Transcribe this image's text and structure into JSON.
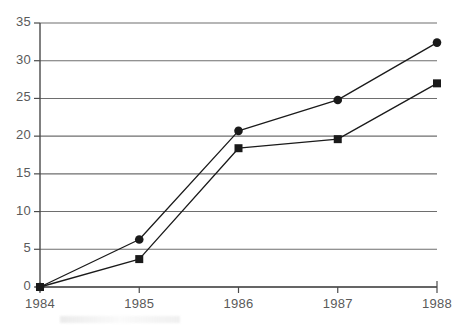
{
  "chart_data": {
    "type": "line",
    "title": "",
    "subtitle": "",
    "xlabel": "",
    "ylabel": "",
    "categories": [
      "1984",
      "1985",
      "1986",
      "1987",
      "1988"
    ],
    "x_tick_labels": [
      "1984",
      "1985",
      "1986",
      "1987",
      "1988"
    ],
    "y_tick_labels": [
      "0",
      "5",
      "10",
      "15",
      "20",
      "25",
      "30",
      "35"
    ],
    "y_ticks": [
      0,
      5,
      10,
      15,
      20,
      25,
      30,
      35
    ],
    "ylim": [
      0,
      35
    ],
    "xlim": [
      "1984",
      "1988"
    ],
    "grid": "horizontal",
    "legend": "none",
    "series": [
      {
        "name": "series-circle",
        "marker": "circle",
        "color": "#1a1a1a",
        "values": [
          0,
          6.3,
          20.7,
          24.8,
          32.4
        ]
      },
      {
        "name": "series-square",
        "marker": "square",
        "color": "#1a1a1a",
        "values": [
          0,
          3.7,
          18.4,
          19.6,
          27.0
        ]
      }
    ],
    "annotations": []
  },
  "style": {
    "gridline_color": "#6e6e6e",
    "axis_color": "#4a4a4a",
    "tick_label_color": "#5a5a5a",
    "background": "#ffffff"
  }
}
